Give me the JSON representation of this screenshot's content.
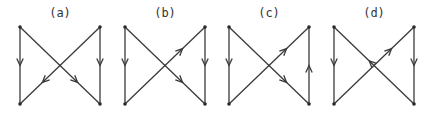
{
  "figure": {
    "panels": [
      {
        "label": "(a)",
        "x_left": 20,
        "x_right": 100,
        "y_top": 27,
        "y_bottom": 104,
        "edges": [
          {
            "from": "TL",
            "to": "BL",
            "arrow": "forward",
            "at": 0.5
          },
          {
            "from": "TR",
            "to": "BR",
            "arrow": "forward",
            "at": 0.5
          },
          {
            "from": "TL",
            "to": "BR",
            "arrow": "forward",
            "at": 0.72
          },
          {
            "from": "TR",
            "to": "BL",
            "arrow": "forward",
            "at": 0.72
          }
        ]
      },
      {
        "label": "(b)",
        "x_left": 125,
        "x_right": 205,
        "y_top": 27,
        "y_bottom": 104,
        "edges": [
          {
            "from": "TL",
            "to": "BL",
            "arrow": "forward",
            "at": 0.5
          },
          {
            "from": "TR",
            "to": "BR",
            "arrow": "forward",
            "at": 0.5
          },
          {
            "from": "TL",
            "to": "BR",
            "arrow": "forward",
            "at": 0.72
          },
          {
            "from": "BL",
            "to": "TR",
            "arrow": "forward",
            "at": 0.72
          }
        ]
      },
      {
        "label": "(c)",
        "x_left": 229,
        "x_right": 309,
        "y_top": 27,
        "y_bottom": 104,
        "edges": [
          {
            "from": "TL",
            "to": "BL",
            "arrow": "forward",
            "at": 0.5
          },
          {
            "from": "BR",
            "to": "TR",
            "arrow": "forward",
            "at": 0.5
          },
          {
            "from": "TL",
            "to": "BR",
            "arrow": "forward",
            "at": 0.72
          },
          {
            "from": "BL",
            "to": "TR",
            "arrow": "forward",
            "at": 0.72
          }
        ]
      },
      {
        "label": "(d)",
        "x_left": 334,
        "x_right": 414,
        "y_top": 27,
        "y_bottom": 104,
        "edges": [
          {
            "from": "TL",
            "to": "BL",
            "arrow": "forward",
            "at": 0.5
          },
          {
            "from": "TR",
            "to": "BR",
            "arrow": "forward",
            "at": 0.5
          },
          {
            "from": "BR",
            "to": "TL",
            "arrow": "forward",
            "at": 0.56
          },
          {
            "from": "BL",
            "to": "TR",
            "arrow": "forward",
            "at": 0.72
          }
        ]
      }
    ],
    "colors": {
      "line": "#3a3a3a",
      "vertex": "#2a2a2a",
      "label": "#333333",
      "background": "#ffffff"
    }
  }
}
